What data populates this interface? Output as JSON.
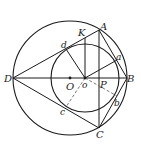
{
  "diagram": {
    "type": "geometry",
    "labels": {
      "A": "A",
      "B": "B",
      "C": "C",
      "D": "D",
      "K": "K",
      "O": "O",
      "o": "o",
      "P": "P",
      "a": "a",
      "b": "b",
      "c": "c",
      "d": "d"
    },
    "colors": {
      "stroke": "#1a1a1a",
      "dashed": "#555555",
      "background": "#ffffff"
    }
  }
}
